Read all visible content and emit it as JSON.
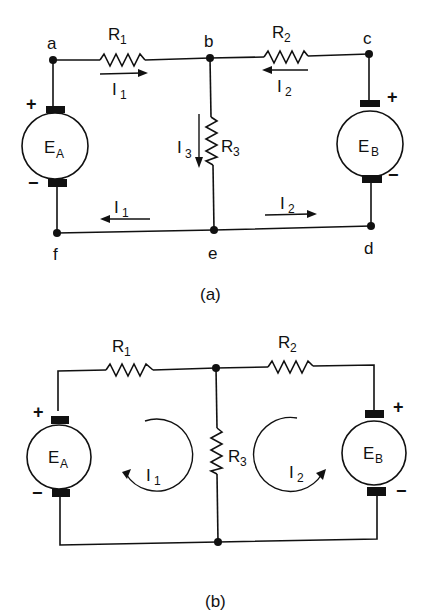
{
  "figure_a": {
    "caption": "(a)",
    "nodes": {
      "a": "a",
      "b": "b",
      "c": "c",
      "d": "d",
      "e": "e",
      "f": "f"
    },
    "resistors": {
      "r1": {
        "main": "R",
        "sub": "1"
      },
      "r2": {
        "main": "R",
        "sub": "2"
      },
      "r3": {
        "main": "R",
        "sub": "3"
      }
    },
    "sources": {
      "ea": {
        "main": "E",
        "sub": "A",
        "plus": "+",
        "minus": "−"
      },
      "eb": {
        "main": "E",
        "sub": "B",
        "plus": "+",
        "minus": "−"
      }
    },
    "currents": {
      "i1_top": {
        "main": "I",
        "sub": "1"
      },
      "i2_top": {
        "main": "I",
        "sub": "2"
      },
      "i3": {
        "main": "I",
        "sub": "3"
      },
      "i1_bottom": {
        "main": "I",
        "sub": "1"
      },
      "i2_bottom": {
        "main": "I",
        "sub": "2"
      }
    }
  },
  "figure_b": {
    "caption": "(b)",
    "resistors": {
      "r1": {
        "main": "R",
        "sub": "1"
      },
      "r2": {
        "main": "R",
        "sub": "2"
      },
      "r3": {
        "main": "R",
        "sub": "3"
      }
    },
    "sources": {
      "ea": {
        "main": "E",
        "sub": "A",
        "plus": "+",
        "minus": "−"
      },
      "eb": {
        "main": "E",
        "sub": "B",
        "plus": "+",
        "minus": "−"
      }
    },
    "loops": {
      "i1": {
        "main": "I",
        "sub": "1",
        "direction": "clockwise"
      },
      "i2": {
        "main": "I",
        "sub": "2",
        "direction": "counterclockwise"
      }
    }
  }
}
